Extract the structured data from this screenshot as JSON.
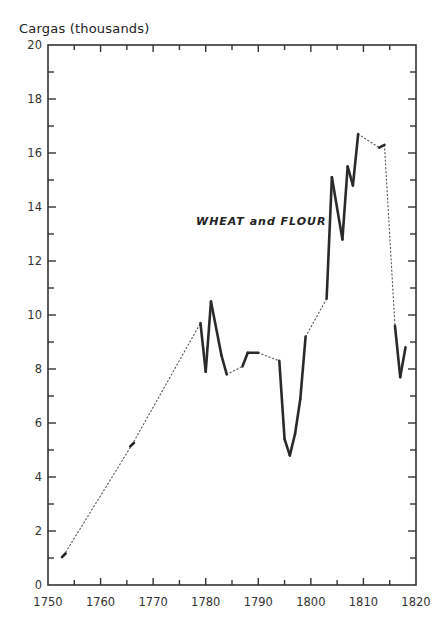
{
  "chart_data": {
    "type": "line",
    "title": "",
    "ylabel": "Cargas (thousands)",
    "xlabel": "",
    "annotation": "WHEAT and FLOUR",
    "xlim": [
      1750,
      1820
    ],
    "ylim": [
      0,
      20
    ],
    "x_ticks": [
      1750,
      1760,
      1770,
      1780,
      1790,
      1800,
      1810,
      1820
    ],
    "y_ticks": [
      0,
      2,
      4,
      6,
      8,
      10,
      12,
      14,
      16,
      18,
      20
    ],
    "grid": false,
    "legend": null,
    "series": [
      {
        "name": "Wheat and Flour",
        "note": "solid segments = continuous annual data; dotted = interpolated gaps",
        "points": [
          {
            "x": 1753,
            "y": 1.1
          },
          {
            "x": 1766,
            "y": 5.2
          },
          {
            "x": 1779,
            "y": 9.7
          },
          {
            "x": 1780,
            "y": 7.9
          },
          {
            "x": 1781,
            "y": 10.5
          },
          {
            "x": 1783,
            "y": 8.5
          },
          {
            "x": 1784,
            "y": 7.8
          },
          {
            "x": 1787,
            "y": 8.1
          },
          {
            "x": 1788,
            "y": 8.6
          },
          {
            "x": 1790,
            "y": 8.6
          },
          {
            "x": 1794,
            "y": 8.3
          },
          {
            "x": 1795,
            "y": 5.4
          },
          {
            "x": 1796,
            "y": 4.8
          },
          {
            "x": 1797,
            "y": 5.6
          },
          {
            "x": 1798,
            "y": 6.9
          },
          {
            "x": 1799,
            "y": 9.2
          },
          {
            "x": 1803,
            "y": 10.6
          },
          {
            "x": 1804,
            "y": 15.1
          },
          {
            "x": 1806,
            "y": 12.8
          },
          {
            "x": 1807,
            "y": 15.5
          },
          {
            "x": 1808,
            "y": 14.8
          },
          {
            "x": 1809,
            "y": 16.7
          },
          {
            "x": 1813,
            "y": 16.2
          },
          {
            "x": 1814,
            "y": 16.3
          },
          {
            "x": 1816,
            "y": 9.6
          },
          {
            "x": 1817,
            "y": 7.7
          },
          {
            "x": 1818,
            "y": 8.8
          }
        ],
        "solid_segments": [
          [
            1779,
            1781
          ],
          [
            1781,
            1784
          ],
          [
            1787,
            1790
          ],
          [
            1794,
            1799
          ],
          [
            1803,
            1809
          ],
          [
            1813,
            1814
          ],
          [
            1816,
            1818
          ]
        ]
      }
    ]
  }
}
